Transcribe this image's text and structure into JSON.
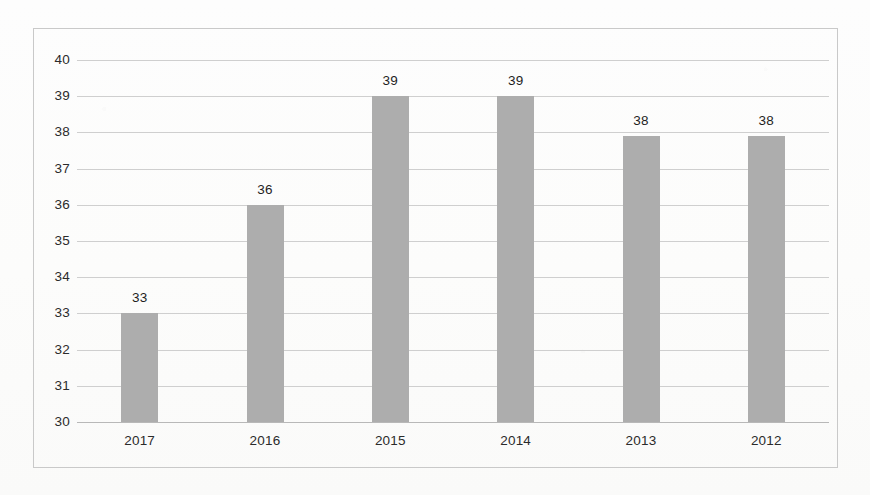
{
  "chart_data": {
    "type": "bar",
    "title": "",
    "subtitle": "",
    "xlabel": "",
    "ylabel": "",
    "categories": [
      "2017",
      "2016",
      "2015",
      "2014",
      "2013",
      "2012"
    ],
    "values": [
      33,
      36,
      39,
      39,
      38,
      38
    ],
    "value_labels": [
      "33",
      "36",
      "39",
      "39",
      "38",
      "38"
    ],
    "ylim": [
      30,
      40
    ],
    "ytick_labels": [
      "40",
      "39",
      "38",
      "37",
      "36",
      "35",
      "34",
      "33",
      "32",
      "31",
      "30"
    ],
    "ytick_values": [
      40,
      39,
      38,
      37,
      36,
      35,
      34,
      33,
      32,
      31,
      30
    ],
    "grid": true,
    "legend": false,
    "legend_position": "none",
    "series": [
      {
        "name": "",
        "values": [
          33,
          36,
          39,
          39,
          38,
          38
        ],
        "color": "#adadad"
      }
    ],
    "bar_color": "#adadad",
    "gridline_color": "#cfcfcf",
    "axis_text_color": "#2b2b2b",
    "frame_color": "#c9c9c9",
    "background_color": "#fdfdfc"
  }
}
